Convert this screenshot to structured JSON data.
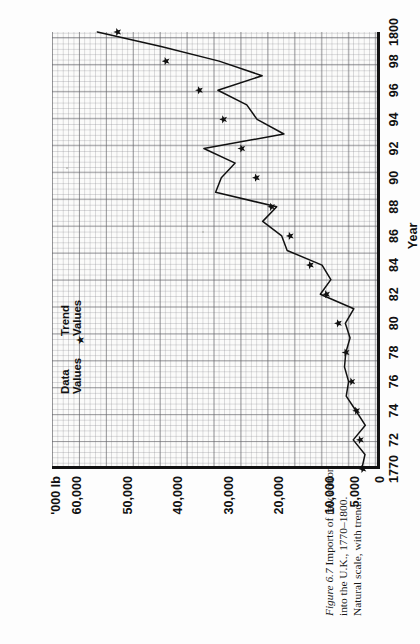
{
  "caption": {
    "figure_number": "Figure 6.7",
    "text": " Imports of raw cotton into the U.K., 1770–1800. Natural scale, with trend."
  },
  "axes": {
    "y_unit_label": "'000 lb",
    "y_ticks": [
      "60,000",
      "50,000",
      "40,000",
      "30,000",
      "20,000",
      "10,000",
      "5,000",
      "0"
    ],
    "x_title": "Year",
    "x_ticks": [
      "1770",
      "72",
      "74",
      "76",
      "78",
      "80",
      "82",
      "84",
      "86",
      "88",
      "90",
      "92",
      "94",
      "96",
      "98",
      "1800"
    ]
  },
  "legend": {
    "data_label": "Data\nValues",
    "trend_label": "Trend\nValues",
    "trend_marker": "★"
  },
  "colors": {
    "ink": "#111111",
    "grid_major": "#5f5f64",
    "grid_minor": "#82828a",
    "paper": "#fbfbfa"
  },
  "chart_data": {
    "type": "line",
    "xlabel": "Year",
    "ylabel": "'000 lb",
    "xlim": [
      1770,
      1800
    ],
    "ylim": [
      0,
      65000
    ],
    "grid": true,
    "legend_position": "top-left",
    "x": [
      1770,
      1771,
      1772,
      1773,
      1774,
      1775,
      1776,
      1777,
      1778,
      1779,
      1780,
      1781,
      1782,
      1783,
      1784,
      1785,
      1786,
      1787,
      1788,
      1789,
      1790,
      1791,
      1792,
      1793,
      1794,
      1795,
      1796,
      1797,
      1798,
      1799,
      1800
    ],
    "series": [
      {
        "name": "Data Values",
        "style": "line",
        "values": [
          3612,
          2970,
          5307,
          2906,
          4765,
          6694,
          6216,
          7037,
          6776,
          5928,
          6877,
          5199,
          11828,
          9736,
          11482,
          18400,
          19475,
          23250,
          20467,
          32576,
          31448,
          28707,
          34907,
          19041,
          24359,
          26401,
          32126,
          23354,
          31881,
          43379,
          56011
        ]
      },
      {
        "name": "Trend Values",
        "style": "star-markers",
        "values": [
          3400,
          3600,
          3900,
          4250,
          4650,
          5100,
          5600,
          6150,
          6750,
          7400,
          8250,
          9300,
          10600,
          12100,
          13800,
          15700,
          17800,
          19700,
          21500,
          23100,
          24500,
          25900,
          27400,
          29100,
          31000,
          33200,
          35800,
          38800,
          42400,
          46800,
          52000
        ]
      }
    ]
  }
}
